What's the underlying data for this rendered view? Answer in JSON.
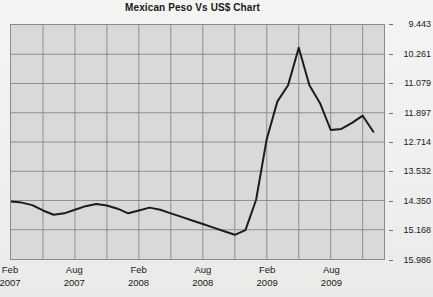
{
  "chart": {
    "title": "Mexican Peso Vs US$ Chart"
  },
  "axes": {
    "y_ticks": [
      "15.986",
      "15.168",
      "14.350",
      "13.532",
      "12.714",
      "11.897",
      "11.079",
      "10.261",
      "9.443"
    ],
    "x_ticks": [
      {
        "month": "Feb",
        "year": "2007"
      },
      {
        "month": "Aug",
        "year": "2007"
      },
      {
        "month": "Feb",
        "year": "2008"
      },
      {
        "month": "Aug",
        "year": "2008"
      },
      {
        "month": "Feb",
        "year": "2009"
      },
      {
        "month": "Aug",
        "year": "2009"
      }
    ]
  },
  "chart_data": {
    "type": "line",
    "title": "Mexican Peso Vs US$ Chart",
    "xlabel": "",
    "ylabel": "",
    "ylim": [
      9.443,
      15.986
    ],
    "ytick_values": [
      9.443,
      10.261,
      11.079,
      11.897,
      12.714,
      13.532,
      14.35,
      15.168,
      15.986
    ],
    "xtick_labels": [
      "Feb 2007",
      "Aug 2007",
      "Feb 2008",
      "Aug 2008",
      "Feb 2009",
      "Aug 2009"
    ],
    "grid": true,
    "legend": "none",
    "series": [
      {
        "name": "Mexican Peso per US$",
        "x": [
          "2007-02",
          "2007-03",
          "2007-04",
          "2007-05",
          "2007-06",
          "2007-07",
          "2007-08",
          "2007-09",
          "2007-10",
          "2007-11",
          "2007-12",
          "2008-01",
          "2008-02",
          "2008-03",
          "2008-04",
          "2008-05",
          "2008-06",
          "2008-07",
          "2008-08",
          "2008-09",
          "2008-10",
          "2008-11",
          "2008-12",
          "2009-01",
          "2009-02",
          "2009-03",
          "2009-04",
          "2009-05",
          "2009-06",
          "2009-07",
          "2009-08",
          "2009-09",
          "2009-10",
          "2009-11",
          "2009-12"
        ],
        "values": [
          11.05,
          11.02,
          10.95,
          10.8,
          10.68,
          10.72,
          10.82,
          10.92,
          10.98,
          10.94,
          10.85,
          10.72,
          10.8,
          10.88,
          10.82,
          10.72,
          10.62,
          10.52,
          10.42,
          10.32,
          10.22,
          10.12,
          10.25,
          11.1,
          12.8,
          13.85,
          14.3,
          15.35,
          14.3,
          13.8,
          13.05,
          13.08,
          13.25,
          13.45,
          13.0
        ]
      }
    ],
    "annotations": {
      "peak": {
        "label": "peak",
        "value": 15.35,
        "at": "2009-03"
      },
      "trough": {
        "label": "trough",
        "value": 10.12,
        "at": "2008-11"
      }
    },
    "colors": {
      "line": "#1c1c1c",
      "plot_background": "#d9d9d9",
      "grid": "#8e8e8e",
      "page_background": "#f0f0ee"
    }
  }
}
